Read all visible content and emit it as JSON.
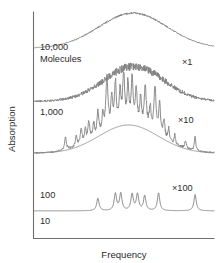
{
  "chart_data": {
    "type": "line",
    "title": "",
    "xlabel": "Frequency",
    "ylabel": "Absorption",
    "grid": false,
    "legend": "none",
    "axis_ticks": "none",
    "colors": {
      "trace": "#808080",
      "envelope": "#8c8c8c",
      "axis": "#6e6e6e",
      "text": "#2b2b2b",
      "background": "#ffffff"
    },
    "xlim": [
      0,
      1
    ],
    "ylim": [
      0,
      1
    ],
    "series": [
      {
        "name": "10,000 Molecules",
        "label": "10,000",
        "label_line2": "Molecules",
        "multiplier": "×1",
        "style": "smooth-broad",
        "baseline_y": 0.84,
        "peak_x": 0.55,
        "peak_height": 0.155,
        "width": 0.19,
        "noise": 0.004,
        "spikes": []
      },
      {
        "name": "1,000 Molecules",
        "label": "1,000",
        "multiplier": "×10",
        "style": "noisy-broad",
        "baseline_y": 0.605,
        "peak_x": 0.555,
        "peak_height": 0.155,
        "width": 0.165,
        "noise": 0.018,
        "spikes": []
      },
      {
        "name": "100 Molecules",
        "label": "100",
        "multiplier": "×100",
        "style": "spiky-with-envelope",
        "baseline_y": 0.375,
        "peak_x": 0.525,
        "peak_height": 0.125,
        "width": 0.165,
        "noise": 0.012,
        "spikes": [
          {
            "x": 0.175,
            "h": 0.055,
            "w": 0.006
          },
          {
            "x": 0.235,
            "h": 0.045,
            "w": 0.006
          },
          {
            "x": 0.262,
            "h": 0.07,
            "w": 0.006
          },
          {
            "x": 0.285,
            "h": 0.055,
            "w": 0.005
          },
          {
            "x": 0.305,
            "h": 0.085,
            "w": 0.006
          },
          {
            "x": 0.332,
            "h": 0.062,
            "w": 0.005
          },
          {
            "x": 0.355,
            "h": 0.105,
            "w": 0.006
          },
          {
            "x": 0.382,
            "h": 0.075,
            "w": 0.005
          },
          {
            "x": 0.405,
            "h": 0.235,
            "w": 0.007
          },
          {
            "x": 0.432,
            "h": 0.125,
            "w": 0.006
          },
          {
            "x": 0.452,
            "h": 0.185,
            "w": 0.006
          },
          {
            "x": 0.478,
            "h": 0.145,
            "w": 0.006
          },
          {
            "x": 0.498,
            "h": 0.205,
            "w": 0.007
          },
          {
            "x": 0.522,
            "h": 0.165,
            "w": 0.006
          },
          {
            "x": 0.545,
            "h": 0.195,
            "w": 0.006
          },
          {
            "x": 0.568,
            "h": 0.145,
            "w": 0.006
          },
          {
            "x": 0.592,
            "h": 0.115,
            "w": 0.006
          },
          {
            "x": 0.618,
            "h": 0.175,
            "w": 0.007
          },
          {
            "x": 0.645,
            "h": 0.095,
            "w": 0.006
          },
          {
            "x": 0.672,
            "h": 0.205,
            "w": 0.007
          },
          {
            "x": 0.698,
            "h": 0.135,
            "w": 0.006
          },
          {
            "x": 0.722,
            "h": 0.075,
            "w": 0.006
          },
          {
            "x": 0.748,
            "h": 0.055,
            "w": 0.005
          },
          {
            "x": 0.782,
            "h": 0.042,
            "w": 0.005
          },
          {
            "x": 0.842,
            "h": 0.035,
            "w": 0.005
          },
          {
            "x": 0.895,
            "h": 0.062,
            "w": 0.005
          }
        ]
      },
      {
        "name": "10 Molecules",
        "label": "10",
        "multiplier": "",
        "style": "discrete-lines",
        "baseline_y": 0.12,
        "noise": 0.0,
        "spikes": [
          {
            "x": 0.355,
            "h": 0.055,
            "w": 0.008
          },
          {
            "x": 0.452,
            "h": 0.075,
            "w": 0.008
          },
          {
            "x": 0.482,
            "h": 0.075,
            "w": 0.008
          },
          {
            "x": 0.545,
            "h": 0.072,
            "w": 0.008
          },
          {
            "x": 0.575,
            "h": 0.072,
            "w": 0.008
          },
          {
            "x": 0.615,
            "h": 0.065,
            "w": 0.008
          },
          {
            "x": 0.692,
            "h": 0.078,
            "w": 0.008
          },
          {
            "x": 0.895,
            "h": 0.072,
            "w": 0.008
          }
        ]
      }
    ]
  },
  "axes": {
    "ylabel": "Absorption",
    "xlabel": "Frequency"
  },
  "labels": {
    "trace1_line1": "10,000",
    "trace1_line2": "Molecules",
    "trace2": "1,000",
    "trace3": "100",
    "trace4": "10",
    "mult1": "×1",
    "mult2": "×10",
    "mult3": "×100"
  }
}
